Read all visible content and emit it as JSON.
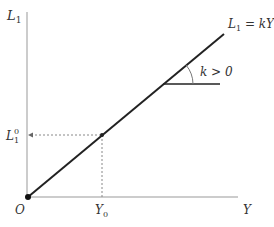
{
  "diagram": {
    "axes": {
      "y_label": "L",
      "y_label_sub": "1",
      "x_label": "Y",
      "origin_label": "O"
    },
    "line": {
      "equation_prefix": "L",
      "equation_sub": "1",
      "equation_suffix": " = kY"
    },
    "slope_annotation": "k > 0",
    "point": {
      "x_label": "Y",
      "x_label_sub": "0",
      "y_label": "L",
      "y_label_sub": "1",
      "y_label_sup": "0"
    },
    "colors": {
      "axis": "#999999",
      "line": "#222222",
      "dashed": "#888888",
      "text": "#333333"
    }
  }
}
